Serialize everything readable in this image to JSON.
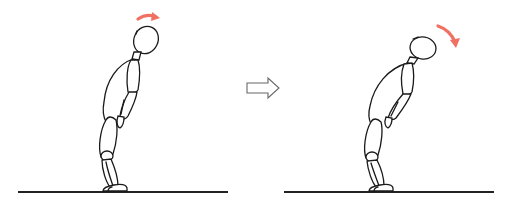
{
  "figure": {
    "panels": [
      {
        "label": "",
        "head_motion_arrow": "curved-arrow-right"
      },
      {
        "label": "",
        "head_motion_arrow": "curved-arrow-down"
      }
    ],
    "transition_arrow": "hollow-right-arrow"
  },
  "colors": {
    "motion_arrow": "#f07062",
    "ink": "#1a1a1a",
    "transition_arrow_stroke": "#666666",
    "background": "#ffffff"
  }
}
